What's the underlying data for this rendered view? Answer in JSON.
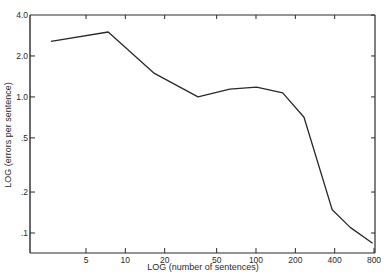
{
  "chart_data": {
    "type": "line",
    "title": "",
    "xlabel": "LOG (number of sentences)",
    "ylabel": "LOG (errors per sentence)",
    "xscale": "log",
    "yscale": "log",
    "xlim": [
      2.2,
      800
    ],
    "ylim": [
      0.07,
      4.0
    ],
    "grid": false,
    "legend": null,
    "x_ticks": [
      5,
      10,
      20,
      50,
      100,
      200,
      400,
      800
    ],
    "x_tick_labels": [
      "5",
      "10",
      "20",
      "50",
      "100",
      "200",
      "400",
      "800"
    ],
    "y_ticks": [
      4.0,
      2.0,
      1.0,
      0.5,
      0.2,
      0.1
    ],
    "y_tick_labels": [
      "4.0",
      "2.0",
      "1.0",
      ".5",
      ".2",
      ".1"
    ],
    "series": [
      {
        "name": "errors per sentence",
        "x": [
          2.7,
          7.4,
          16.7,
          36,
          63,
          101,
          160,
          233,
          383,
          526,
          780
        ],
        "y": [
          2.56,
          3.0,
          1.49,
          1.0,
          1.14,
          1.18,
          1.07,
          0.71,
          0.148,
          0.11,
          0.084
        ]
      }
    ]
  },
  "colors": {
    "line": "#2a2a2a",
    "axis": "#2a2a2a",
    "background": "#ffffff"
  }
}
